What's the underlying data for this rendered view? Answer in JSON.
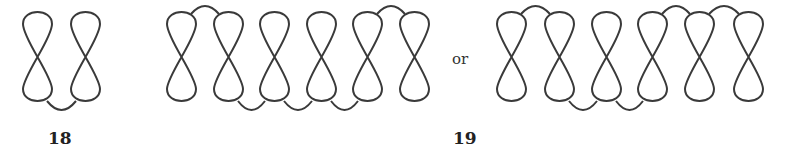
{
  "figures": [
    {
      "id": "18",
      "label": "18",
      "label_pos": {
        "x": 48,
        "y": 131
      },
      "eights_left_x": [
        23,
        71
      ],
      "top_arcs": [],
      "bottom_arcs": [
        [
          0,
          1
        ]
      ]
    },
    {
      "id": "19a",
      "label": "",
      "eights_left_x": [
        167,
        214,
        260,
        307,
        353,
        400
      ],
      "top_arcs": [
        [
          0,
          1
        ],
        [
          4,
          5
        ]
      ],
      "bottom_arcs": [
        [
          1,
          2
        ],
        [
          2,
          3
        ],
        [
          3,
          4
        ]
      ]
    },
    {
      "id": "19b",
      "label": "19",
      "label_pos": {
        "x": 453,
        "y": 131
      },
      "eights_left_x": [
        497,
        545,
        592,
        638,
        685,
        734
      ],
      "top_arcs": [
        [
          0,
          1
        ],
        [
          3,
          4
        ],
        [
          4,
          5
        ]
      ],
      "bottom_arcs": [
        [
          1,
          2
        ],
        [
          2,
          3
        ]
      ]
    }
  ],
  "connector_text": "or",
  "labels": {
    "fig18": "18",
    "fig19": "19"
  },
  "stroke_color": "#3a3a3a"
}
